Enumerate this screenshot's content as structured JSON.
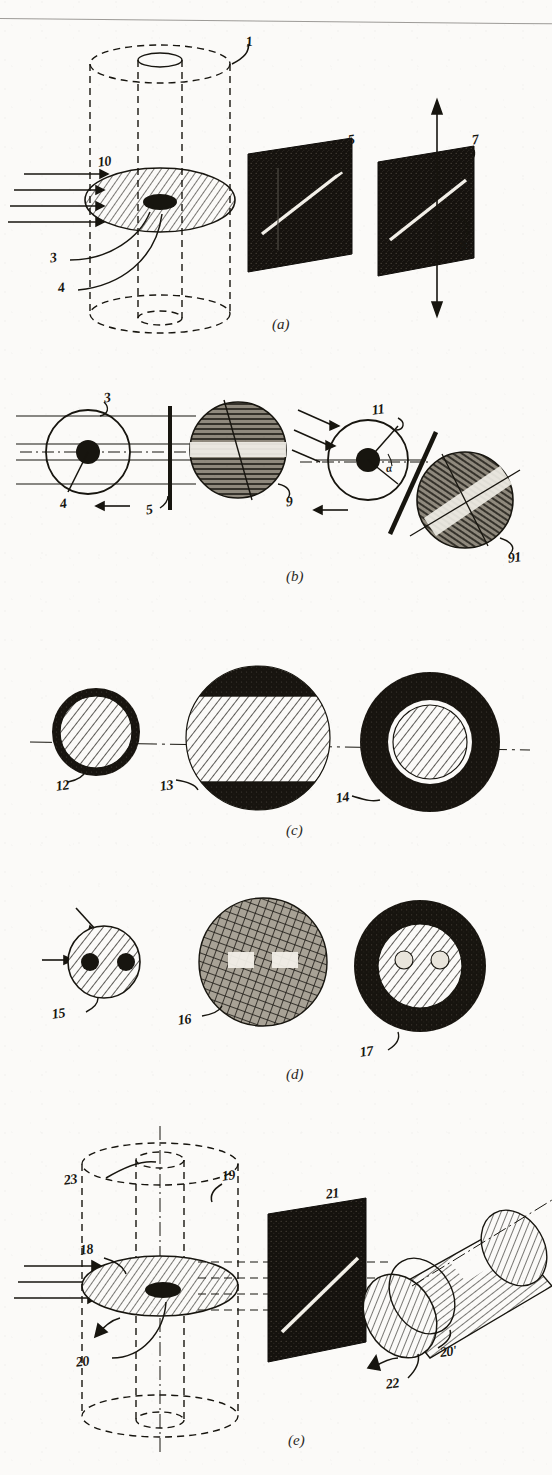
{
  "figure": {
    "kind": "patent-line-drawing",
    "title_fragment_cut_off_at_top": "",
    "panel_labels": [
      "(a)",
      "(b)",
      "(c)",
      "(d)",
      "(e)"
    ],
    "colors": {
      "ink": "#17150f",
      "paper": "#fbfaf8",
      "screen_fill": "#1a1713",
      "hatch": "#2a2620",
      "slit_light": "#f2efe8"
    }
  },
  "panel_a": {
    "label": "(a)",
    "callouts": [
      {
        "id": "1",
        "text": "1"
      },
      {
        "id": "10",
        "text": "10"
      },
      {
        "id": "3",
        "text": "3"
      },
      {
        "id": "4",
        "text": "4"
      },
      {
        "id": "5",
        "text": "5"
      },
      {
        "id": "7",
        "text": "7"
      },
      {
        "id": "8",
        "text": "8"
      }
    ],
    "elements": {
      "cylinder": "dashed vertical cylinder with inner bore",
      "disc": "hatched ellipse disc with dark central spot",
      "beam_arrows": 4,
      "screens": 2,
      "screen_slits": [
        "diagonal white slit",
        "diagonal white slit"
      ],
      "vertical_double_arrow": true
    }
  },
  "panel_b": {
    "label": "(b)",
    "callouts": [
      {
        "id": "3",
        "text": "3"
      },
      {
        "id": "4",
        "text": "4"
      },
      {
        "id": "5",
        "text": "5"
      },
      {
        "id": "9",
        "text": "9"
      },
      {
        "id": "11",
        "text": "11"
      },
      {
        "id": "91",
        "text": "91"
      },
      {
        "id": "alpha",
        "text": "α"
      }
    ],
    "elements": {
      "left_group": "circle 3 with dark hub 4, horizontal rays, slit bar 5, hatched circle 9 with light band",
      "right_group": "tilted circle 11 with dark hub and angle α, tilted slit bar, hatched circle 91 with diagonal light band",
      "rotation_arrows": 2
    }
  },
  "panel_c": {
    "label": "(c)",
    "callouts": [
      {
        "id": "12",
        "text": "12"
      },
      {
        "id": "13",
        "text": "13"
      },
      {
        "id": "14",
        "text": "14"
      }
    ],
    "elements": {
      "circle_12": "small dark-rim circle with 45° hatched core",
      "circle_13": "large circle, dark caps top and bottom, wide hatched central band",
      "circle_14": "large solid dark annulus with hatched inner disc",
      "axis_line": "dash-dot horizontal centre line through all three"
    }
  },
  "panel_d": {
    "label": "(d)",
    "callouts": [
      {
        "id": "15",
        "text": "15"
      },
      {
        "id": "16",
        "text": "16"
      },
      {
        "id": "17",
        "text": "17"
      }
    ],
    "elements": {
      "circle_15": "hatched circle with two solid dark spots, two incoming arrows",
      "circle_16": "cross-hatched circle with two bright rectangular patches",
      "circle_17": "dark annulus with hatched inner disc containing two small light circles",
      "arrows": 2
    }
  },
  "panel_e": {
    "label": "(e)",
    "callouts": [
      {
        "id": "18",
        "text": "18"
      },
      {
        "id": "19",
        "text": "19"
      },
      {
        "id": "20",
        "text": "20"
      },
      {
        "id": "20p",
        "text": "20'"
      },
      {
        "id": "21",
        "text": "21"
      },
      {
        "id": "22",
        "text": "22"
      },
      {
        "id": "23",
        "text": "23"
      }
    ],
    "elements": {
      "cylinder": "dashed vertical cylinder with bore and centre axis",
      "disc": "hatched ellipse disc 18 with dark central spot",
      "beam_arrows": 3,
      "screen": "dark parallelogram screen 21 with diagonal white slit",
      "drum": "tilted hatched cylinder 22 with light band, end face 20'",
      "rotation_arrows": 2
    }
  }
}
